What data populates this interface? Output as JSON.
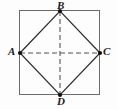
{
  "figure": {
    "background_color": "#fdfdfd",
    "outer_square": {
      "name": "outer-square",
      "stroke_color": "#6b6b6b",
      "stroke_width": 1,
      "line_style": "solid",
      "corners": [
        {
          "x": 19,
          "y": 10
        },
        {
          "x": 100,
          "y": 10
        },
        {
          "x": 100,
          "y": 95
        },
        {
          "x": 19,
          "y": 95
        }
      ]
    },
    "inner_diamond": {
      "name": "inner-diamond",
      "stroke_color": "#2b2b2b",
      "stroke_width": 1.1,
      "line_style": "solid",
      "vertices": [
        {
          "label": "A",
          "x": 20,
          "y": 53
        },
        {
          "label": "B",
          "x": 60,
          "y": 11
        },
        {
          "label": "C",
          "x": 100,
          "y": 53
        },
        {
          "label": "D",
          "x": 60,
          "y": 95
        }
      ]
    },
    "diagonals": [
      {
        "name": "diagonal-AC",
        "from": "A",
        "to": "C",
        "x1": 20,
        "y1": 53,
        "x2": 100,
        "y2": 53,
        "line_style": "dashed",
        "stroke_color": "#555555",
        "dash_pattern": "5,3"
      },
      {
        "name": "diagonal-BD",
        "from": "B",
        "to": "D",
        "x1": 60,
        "y1": 11,
        "x2": 60,
        "y2": 95,
        "line_style": "dashed",
        "stroke_color": "#555555",
        "dash_pattern": "5,3"
      }
    ],
    "vertex_markers": {
      "shape": "filled-circle",
      "radius": 2,
      "fill_color": "#111111"
    },
    "labels": {
      "A": "A",
      "B": "B",
      "C": "C",
      "D": "D"
    }
  }
}
